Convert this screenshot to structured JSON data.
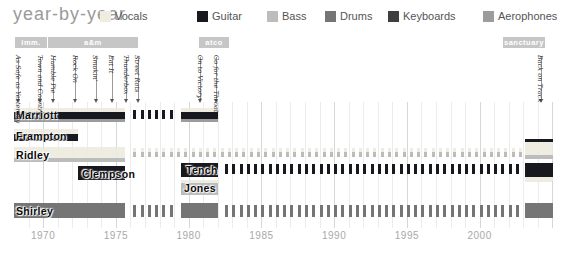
{
  "chart_data": {
    "type": "timeline",
    "title": "year-by-year",
    "x_axis": {
      "ticks": [
        1970,
        1975,
        1980,
        1985,
        1990,
        1995,
        2000
      ],
      "range": [
        1968,
        2005.3
      ],
      "grid": "yearly"
    },
    "legend": [
      {
        "label": "Vocals",
        "color": "#efeddf",
        "x": 100
      },
      {
        "label": "Guitar",
        "color": "#18181f",
        "x": 197
      },
      {
        "label": "Bass",
        "color": "#bcbcbc",
        "x": 267
      },
      {
        "label": "Drums",
        "color": "#757575",
        "x": 325
      },
      {
        "label": "Keyboards",
        "color": "#3f3f3f",
        "x": 388
      },
      {
        "label": "Aerophones",
        "color": "#9c9c9c",
        "x": 483
      }
    ],
    "instrument_colors": {
      "vocals": "rgba(237,235,221,0.88)",
      "guitar": "#18181f",
      "bass": "#bcbcbc",
      "drums": "#757575",
      "keyboards": "#3f3f3f",
      "aerophones": "#9c9c9c"
    },
    "record_labels": [
      {
        "name": "imm.",
        "start": 1968.1,
        "end": 1970.25
      },
      {
        "name": "a&m",
        "start": 1970.35,
        "end": 1976.5
      },
      {
        "name": "atco",
        "start": 1980.7,
        "end": 1982.8
      },
      {
        "name": "sanctuary",
        "start": 2001.6,
        "end": 2004.5
      }
    ],
    "albums": [
      {
        "title": "As Safe as Yesterday",
        "year": 1968.3
      },
      {
        "title": "Town and Country",
        "year": 1969.8
      },
      {
        "title": "Humble Pie",
        "year": 1970.7
      },
      {
        "title": "Rock On",
        "year": 1972.2
      },
      {
        "title": "Smokin'",
        "year": 1973.6
      },
      {
        "title": "Eat It",
        "year": 1974.7
      },
      {
        "title": "Thunderbox",
        "year": 1975.7
      },
      {
        "title": "Street Rats",
        "year": 1976.5
      },
      {
        "title": "On to Victory",
        "year": 1980.8
      },
      {
        "title": "Go for the Throat",
        "year": 1981.9
      },
      {
        "title": "Back on Track",
        "year": 2004.2
      }
    ],
    "members": [
      {
        "name": "Marriott",
        "row_top": 108,
        "label": {
          "x": 16,
          "y": 109
        },
        "segments": [
          {
            "kind": "bar",
            "start": 1968.0,
            "end": 1975.6,
            "stripes": [
              [
                "vocals",
                4
              ],
              [
                "guitar",
                7
              ],
              [
                "aerophones",
                3
              ]
            ]
          },
          {
            "kind": "dashes",
            "start": 1976.2,
            "end": 1978.9,
            "step": 0.5,
            "dy": 2,
            "stripes": [
              [
                "guitar",
                9
              ]
            ]
          },
          {
            "kind": "bar",
            "start": 1979.5,
            "end": 1982.0,
            "stripes": [
              [
                "vocals",
                4
              ],
              [
                "guitar",
                7
              ],
              [
                "aerophones",
                3
              ]
            ]
          }
        ]
      },
      {
        "name": "Frampton",
        "row_top": 129,
        "label": {
          "x": 16,
          "y": 130
        },
        "segments": [
          {
            "kind": "bar",
            "start": 1968.0,
            "end": 1972.4,
            "stripes": [
              [
                "vocals",
                5
              ],
              [
                "guitar",
                7
              ]
            ]
          }
        ]
      },
      {
        "name": "Ridley",
        "row_top": 147,
        "label": {
          "x": 16,
          "y": 149
        },
        "segments": [
          {
            "kind": "bar",
            "start": 1968.0,
            "end": 1975.6,
            "stripes": [
              [
                "vocals",
                11
              ],
              [
                "bass",
                4
              ]
            ]
          },
          {
            "kind": "dashes",
            "start": 1976.2,
            "end": 2002.9,
            "step": 0.5,
            "dy": 1,
            "stripes": [
              [
                "vocals",
                4
              ],
              [
                "bass",
                5
              ]
            ]
          },
          {
            "kind": "bar",
            "start": 2003.1,
            "end": 2005.05,
            "top": 139,
            "stripes": [
              [
                "guitar",
                3
              ],
              [
                "vocals",
                13
              ],
              [
                "bass",
                4
              ]
            ]
          }
        ]
      },
      {
        "name": "Clempson",
        "row_top": 166,
        "label": {
          "x": 82,
          "y": 168
        },
        "segments": [
          {
            "kind": "bar",
            "start": 1972.4,
            "end": 1975.6,
            "stripes": [
              [
                "guitar",
                14
              ]
            ]
          }
        ]
      },
      {
        "name": "Tench",
        "row_top": 163,
        "label": {
          "x": 186,
          "y": 164
        },
        "segments": [
          {
            "kind": "bar",
            "start": 1979.5,
            "end": 1982.0,
            "stripes": [
              [
                "guitar",
                14
              ]
            ]
          },
          {
            "kind": "dashes",
            "start": 1982.5,
            "end": 2002.9,
            "step": 0.5,
            "dy": 1,
            "stripes": [
              [
                "guitar",
                10
              ]
            ]
          },
          {
            "kind": "bar",
            "start": 2003.1,
            "end": 2005.05,
            "stripes": [
              [
                "guitar",
                14
              ],
              [
                "vocals",
                5
              ]
            ]
          }
        ]
      },
      {
        "name": "Jones",
        "row_top": 180,
        "label": {
          "x": 184,
          "y": 182
        },
        "segments": [
          {
            "kind": "bar",
            "start": 1979.5,
            "end": 1982.0,
            "stripes": [
              [
                "vocals",
                3
              ],
              [
                "bass",
                12
              ]
            ]
          }
        ]
      },
      {
        "name": "Shirley",
        "row_top": 203,
        "label": {
          "x": 16,
          "y": 205
        },
        "segments": [
          {
            "kind": "bar",
            "start": 1968.0,
            "end": 1975.6,
            "stripes": [
              [
                "drums",
                15
              ]
            ]
          },
          {
            "kind": "dashes",
            "start": 1976.2,
            "end": 1978.9,
            "step": 0.5,
            "dy": 2,
            "stripes": [
              [
                "drums",
                12
              ]
            ]
          },
          {
            "kind": "bar",
            "start": 1979.5,
            "end": 1982.0,
            "stripes": [
              [
                "drums",
                15
              ]
            ]
          },
          {
            "kind": "dashes",
            "start": 1982.5,
            "end": 2002.9,
            "step": 0.5,
            "dy": 2,
            "stripes": [
              [
                "drums",
                12
              ]
            ]
          },
          {
            "kind": "bar",
            "start": 2003.1,
            "end": 2005.05,
            "stripes": [
              [
                "drums",
                15
              ]
            ]
          }
        ]
      }
    ]
  }
}
